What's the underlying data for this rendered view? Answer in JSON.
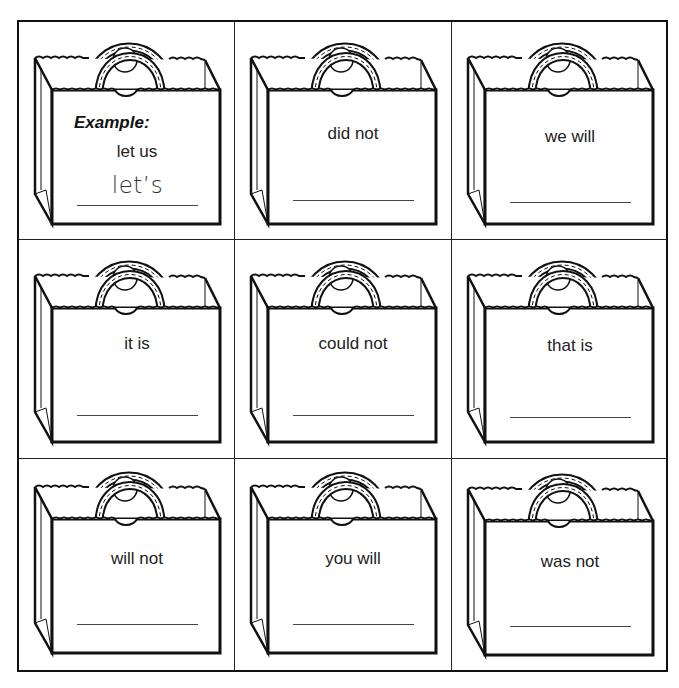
{
  "worksheet": {
    "title": "Contractions shopping bags",
    "example_label": "Example:",
    "cells": [
      {
        "phrase": "let us",
        "answer": "let’s",
        "is_example": true
      },
      {
        "phrase": "did not",
        "answer": ""
      },
      {
        "phrase": "we will",
        "answer": ""
      },
      {
        "phrase": "it is",
        "answer": ""
      },
      {
        "phrase": "could not",
        "answer": ""
      },
      {
        "phrase": "that is",
        "answer": ""
      },
      {
        "phrase": "will not",
        "answer": ""
      },
      {
        "phrase": "you will",
        "answer": ""
      },
      {
        "phrase": "was not",
        "answer": ""
      }
    ]
  },
  "colors": {
    "ink": "#111111",
    "paper": "#ffffff"
  }
}
